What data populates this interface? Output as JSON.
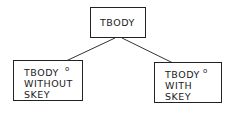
{
  "diagram": {
    "type": "tree",
    "root": {
      "label": "TBODY"
    },
    "children": [
      {
        "lines": [
          "TBODY",
          "WITHOUT",
          "SKEY"
        ],
        "marker": "o"
      },
      {
        "lines": [
          "TBODY",
          "WITH",
          "SKEY"
        ],
        "marker": "o"
      }
    ],
    "colors": {
      "stroke": "#222222",
      "background": "#ffffff"
    }
  }
}
